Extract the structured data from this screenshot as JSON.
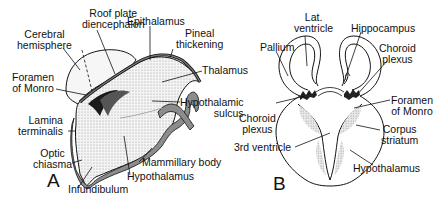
{
  "figure": {
    "panels": [
      {
        "letter": "A",
        "description": "Sagittal view of embryonic diencephalon",
        "labels": {
          "roof_plate": [
            "Roof plate",
            "diencephalon"
          ],
          "epithalamus": "Epithalamus",
          "cerebral_hemisphere": [
            "Cerebral",
            "hemisphere"
          ],
          "pineal_thickening": [
            "Pineal",
            "thickening"
          ],
          "thalamus": "Thalamus",
          "foramen_monro": [
            "Foramen",
            "of Monro"
          ],
          "hypothalamic_sulcus": [
            "Hypothalamic",
            "sulcus"
          ],
          "lamina_terminalis": [
            "Lamina",
            "terminalis"
          ],
          "optic_chiasma": [
            "Optic",
            "chiasma"
          ],
          "mammillary_body": "Mammillary body",
          "hypothalamus": "Hypothalamus",
          "infundibulum": "Infundibulum"
        }
      },
      {
        "letter": "B",
        "description": "Coronal section through forebrain",
        "labels": {
          "lat_ventricle": [
            "Lat.",
            "ventricle"
          ],
          "hippocampus": "Hippocampus",
          "pallium": "Pallium",
          "choroid_plexus_right": [
            "Choroid",
            "plexus"
          ],
          "foramen_monro": [
            "Foramen",
            "of Monro"
          ],
          "choroid_plexus_left": [
            "Choroid",
            "plexus"
          ],
          "corpus_striatum": [
            "Corpus",
            "striatum"
          ],
          "third_ventricle": "3rd ventricle",
          "hypothalamus": "Hypothalamus"
        }
      }
    ],
    "colors": {
      "line": "#111111",
      "fill_grey": "#8c8c8c",
      "stipple": "#c8c8c8",
      "background": "#ffffff"
    }
  }
}
